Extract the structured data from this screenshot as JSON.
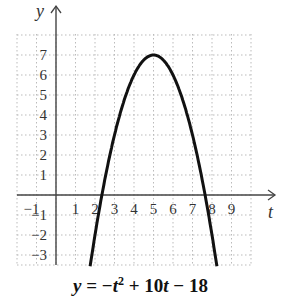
{
  "chart_data": {
    "type": "line",
    "xlabel": "t",
    "ylabel": "y",
    "xlim": [
      -2,
      10
    ],
    "ylim": [
      -3.5,
      8
    ],
    "grid": true,
    "x_tick_labels": [
      "−1",
      "1",
      "2",
      "3",
      "4",
      "5",
      "6",
      "7",
      "8",
      "9"
    ],
    "y_tick_labels": [
      "7",
      "6",
      "5",
      "4",
      "3",
      "2",
      "1",
      "−1",
      "−2",
      "−3"
    ],
    "series": [
      {
        "name": "y = -t^2 + 10t - 18",
        "x": [
          1.8,
          2,
          2.5,
          3,
          3.5,
          4,
          4.5,
          5,
          5.5,
          6,
          6.5,
          7,
          7.5,
          8,
          8.2
        ],
        "values": [
          -3.24,
          -2,
          0.75,
          3,
          4.75,
          6,
          6.75,
          7,
          6.75,
          6,
          4.75,
          3,
          0.75,
          -2,
          -3.24
        ]
      }
    ],
    "annotations": {
      "vertex": [
        5,
        7
      ],
      "roots": [
        2.27,
        7.73
      ]
    }
  },
  "equation": {
    "lhs": "y",
    "eq": " = −",
    "t": "t",
    "exp": "2",
    "rest1": " + 10",
    "t2": "t",
    "rest2": " − 18"
  },
  "axes": {
    "x_name": "t",
    "y_name": "y"
  }
}
